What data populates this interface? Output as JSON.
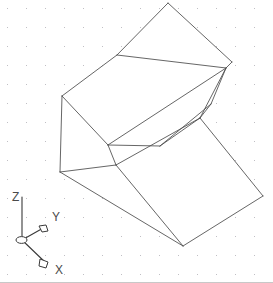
{
  "viewport": {
    "width": 273,
    "height": 283,
    "background_color": "#ffffff",
    "projection": "isometric",
    "display_style": "2D Wireframe",
    "grid": {
      "visible": true,
      "style": "dot",
      "spacing_px": 19,
      "color": "#c0bfc4",
      "origin_offset_x": 7,
      "origin_offset_y": 8
    },
    "edge_color": "#4a4a4a",
    "edge_width": 0.85
  },
  "ucs_icon": {
    "name": "ucs-axis-indicator",
    "origin": {
      "x": 22,
      "y": 240
    },
    "axes": [
      {
        "id": "z-axis",
        "label": "Z",
        "tip": {
          "x": 22,
          "y": 197
        },
        "label_pos": {
          "x": 12,
          "y": 200
        },
        "arrowhead": false
      },
      {
        "id": "y-axis",
        "label": "Y",
        "tip": {
          "x": 45,
          "y": 227
        },
        "label_pos": {
          "x": 52,
          "y": 220
        },
        "arrowhead": true
      },
      {
        "id": "x-axis",
        "label": "X",
        "tip": {
          "x": 47,
          "y": 264
        },
        "label_pos": {
          "x": 55,
          "y": 273
        },
        "arrowhead": true
      }
    ]
  },
  "model": {
    "name": "inclined-channel-wedge-block",
    "description": "Isometric wireframe of a wedge block with a V-shaped inclined channel",
    "vertex_count": 16,
    "faces": [
      {
        "id": "top-upper-flap",
        "kind": "planar-quad"
      },
      {
        "id": "top-lower-flap",
        "kind": "planar-quad"
      },
      {
        "id": "channel-left-wall",
        "kind": "planar-quad"
      },
      {
        "id": "channel-right-wall",
        "kind": "planar-quad"
      },
      {
        "id": "front-left-vertical",
        "kind": "planar-quad"
      },
      {
        "id": "lower-incline-ramp",
        "kind": "planar-quad"
      }
    ],
    "edges": [
      {
        "id": "e01",
        "from": [
          168,
          3
        ],
        "to": [
          232,
          62
        ]
      },
      {
        "id": "e02",
        "from": [
          232,
          62
        ],
        "to": [
          226,
          68
        ]
      },
      {
        "id": "e03",
        "from": [
          226,
          68
        ],
        "to": [
          117,
          55
        ]
      },
      {
        "id": "e04",
        "from": [
          117,
          55
        ],
        "to": [
          168,
          3
        ]
      },
      {
        "id": "e05",
        "from": [
          117,
          55
        ],
        "to": [
          62,
          96
        ]
      },
      {
        "id": "e06",
        "from": [
          62,
          96
        ],
        "to": [
          108,
          145
        ]
      },
      {
        "id": "e07",
        "from": [
          108,
          145
        ],
        "to": [
          226,
          68
        ]
      },
      {
        "id": "e08",
        "from": [
          226,
          68
        ],
        "to": [
          200,
          118
        ]
      },
      {
        "id": "e09",
        "from": [
          200,
          118
        ],
        "to": [
          160,
          146
        ]
      },
      {
        "id": "e10",
        "from": [
          160,
          146
        ],
        "to": [
          108,
          145
        ]
      },
      {
        "id": "e11",
        "from": [
          108,
          145
        ],
        "to": [
          116,
          165
        ]
      },
      {
        "id": "e12",
        "from": [
          116,
          165
        ],
        "to": [
          200,
          118
        ]
      },
      {
        "id": "e13",
        "from": [
          116,
          165
        ],
        "to": [
          60,
          172
        ]
      },
      {
        "id": "e14",
        "from": [
          62,
          96
        ],
        "to": [
          60,
          172
        ]
      },
      {
        "id": "e15",
        "from": [
          60,
          172
        ],
        "to": [
          183,
          246
        ]
      },
      {
        "id": "e16",
        "from": [
          116,
          165
        ],
        "to": [
          183,
          246
        ]
      },
      {
        "id": "e17",
        "from": [
          200,
          118
        ],
        "to": [
          263,
          196
        ]
      },
      {
        "id": "e18",
        "from": [
          263,
          196
        ],
        "to": [
          183,
          246
        ]
      },
      {
        "id": "e19",
        "from": [
          226,
          68
        ],
        "to": [
          211,
          104
        ]
      },
      {
        "id": "e20",
        "from": [
          211,
          104
        ],
        "to": [
          160,
          146
        ]
      },
      {
        "id": "e21",
        "from": [
          211,
          104
        ],
        "to": [
          200,
          118
        ]
      }
    ]
  }
}
